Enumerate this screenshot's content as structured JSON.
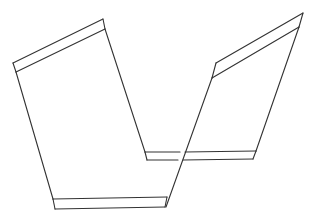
{
  "diagram": {
    "width": 316,
    "height": 219,
    "background": "#ffffff",
    "stroke_color": "#333333",
    "stroke_width": 1.1,
    "shapes": [
      {
        "name": "left-panel",
        "outline": "13,63 103,19 145,152 167,197 53,199",
        "top_band": "16,72 105,29",
        "bottom_band": "55,209 165,207",
        "bottom_band_sides": [
          "53,199 55,209",
          "167,197 165,207"
        ]
      },
      {
        "name": "right-panel",
        "outline": "216,63 303,13 256,151 143,152",
        "top_band": "212,78 299,27",
        "bottom_band": "146,160 253,160",
        "long_diagonal": "212,78 166,207"
      }
    ]
  }
}
